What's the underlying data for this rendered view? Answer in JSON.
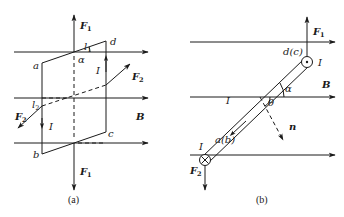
{
  "figure": {
    "panel_a": {
      "caption": "(a)",
      "field_label": "B",
      "force_top": {
        "symbol": "F",
        "sub": "1"
      },
      "force_bottom": {
        "symbol": "F",
        "sub": "1"
      },
      "force_right": {
        "symbol": "F",
        "sub": "2"
      },
      "force_left": {
        "symbol": "F",
        "sub": "2"
      },
      "edge_top": {
        "symbol": "l",
        "sub": "1"
      },
      "edge_back": {
        "symbol": "l",
        "sub": "2"
      },
      "angle": "α",
      "current_right": "I",
      "current_left": "I",
      "corner_a": "a",
      "corner_b": "b",
      "corner_c": "c",
      "corner_d": "d"
    },
    "panel_b": {
      "caption": "(b)",
      "field_label": "B",
      "force_top": {
        "symbol": "F",
        "sub": "1"
      },
      "force_bottom": {
        "symbol": "F",
        "sub": "2"
      },
      "top_end_label": "d(c)",
      "bottom_end_label": "a(b)",
      "current_top": "I",
      "current_bottom": "I",
      "current_rod": "I",
      "angle_alpha": "α",
      "angle_theta": "θ",
      "normal_label": "n"
    },
    "colors": {
      "ink": "#1a1a1a",
      "background": "#ffffff"
    }
  }
}
